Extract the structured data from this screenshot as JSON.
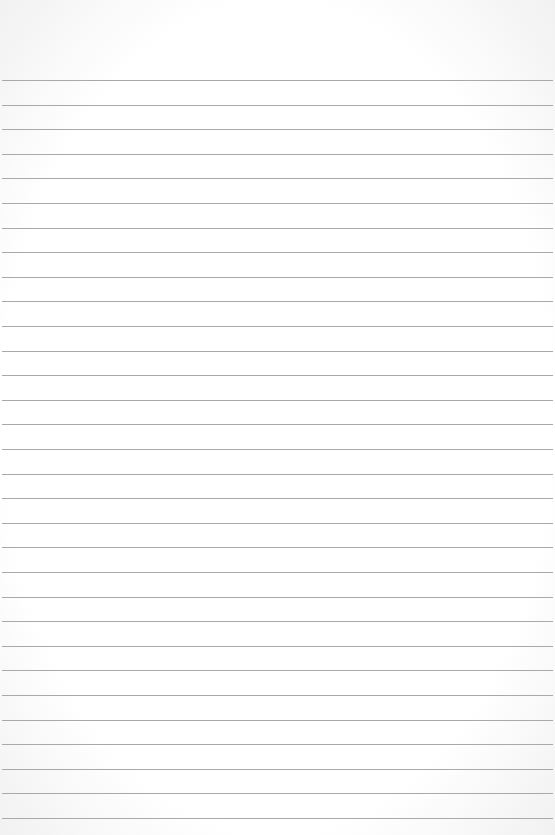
{
  "page": {
    "type": "lined-paper",
    "background_color": "#ffffff",
    "line_color": "#a9a9a9",
    "line_count": 31,
    "first_line_y": 80,
    "line_spacing": 24.6,
    "text": ""
  }
}
